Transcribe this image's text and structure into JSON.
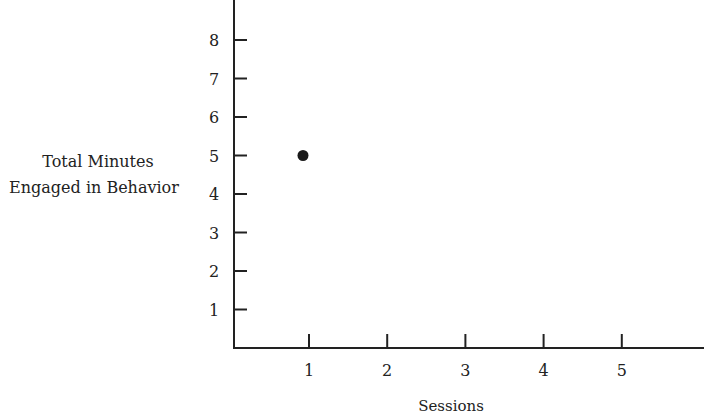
{
  "chart_data": {
    "type": "scatter",
    "title": "",
    "xlabel": "Sessions",
    "ylabel": [
      "Total Minutes",
      "Engaged in Behavior"
    ],
    "x_ticks": [
      1,
      2,
      3,
      4,
      5
    ],
    "y_ticks": [
      1,
      2,
      3,
      4,
      5,
      6,
      7,
      8
    ],
    "xlim": [
      0,
      6
    ],
    "ylim": [
      0,
      9
    ],
    "grid": false,
    "legend": null,
    "series": [
      {
        "name": "Total Minutes Engaged in Behavior",
        "points": [
          {
            "x": 1,
            "y": 5
          }
        ]
      }
    ]
  },
  "colors": {
    "axis": "#222222",
    "point": "#1a1a1a",
    "text": "#222222"
  }
}
